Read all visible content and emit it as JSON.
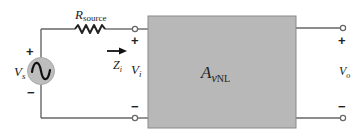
{
  "diagram": {
    "type": "two-port amplifier circuit",
    "colors": {
      "wire": "#666666",
      "box_fill": "#b8b8b8",
      "box_stroke": "#8a8a8a",
      "source_fill": "#bdbdbd",
      "text": "#222222"
    },
    "source": {
      "label_main": "V",
      "label_sub": "s",
      "plus": "+",
      "minus": "−",
      "icon": "ac-source-icon"
    },
    "resistor": {
      "label_main": "R",
      "label_sub": "source"
    },
    "input": {
      "impedance_main": "Z",
      "impedance_sub": "i",
      "voltage_main": "V",
      "voltage_sub": "i",
      "plus": "+",
      "minus": "−",
      "arrow_icon": "right-arrow-icon"
    },
    "amplifier": {
      "label_main": "A",
      "label_sub_italic": "v",
      "label_sub": "NL"
    },
    "output": {
      "voltage_main": "V",
      "voltage_sub": "o",
      "plus": "+",
      "minus": "−"
    }
  }
}
